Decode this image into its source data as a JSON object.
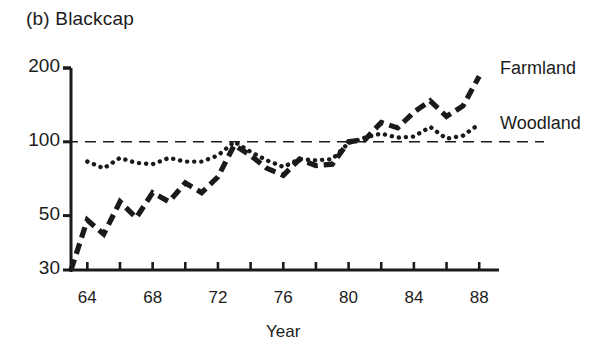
{
  "figure": {
    "panel_label": "(b) Blackcap",
    "axis_title_x": "Year",
    "ink_color": "#1a1a1a",
    "background": "#ffffff"
  },
  "legend": {
    "entries": [
      {
        "label": "Farmland",
        "style": "dashed"
      },
      {
        "label": "Woodland",
        "style": "dotted"
      }
    ]
  },
  "chart_data": {
    "type": "line",
    "title": "(b) Blackcap",
    "subtitle": "",
    "xlabel": "Year",
    "ylabel": "",
    "yscale": "log",
    "ylim": [
      30,
      215
    ],
    "xlim": [
      1963,
      1988.6
    ],
    "grid": false,
    "legend_position": "right",
    "reference_line": {
      "value": 100,
      "style": "dashed",
      "label": ""
    },
    "ytick_values": [
      30,
      50,
      100,
      200
    ],
    "ytick_labels": [
      "30",
      "50",
      "100",
      "200"
    ],
    "xtick_values": [
      1964,
      1966,
      1968,
      1970,
      1972,
      1974,
      1976,
      1978,
      1980,
      1982,
      1984,
      1986,
      1988
    ],
    "xtick_labels": [
      "64",
      "",
      "68",
      "",
      "72",
      "",
      "76",
      "",
      "80",
      "",
      "84",
      "",
      "88"
    ],
    "x": [
      1963,
      1964,
      1965,
      1966,
      1967,
      1968,
      1969,
      1970,
      1971,
      1972,
      1973,
      1974,
      1975,
      1976,
      1977,
      1978,
      1979,
      1980,
      1981,
      1982,
      1983,
      1984,
      1985,
      1986,
      1987,
      1988
    ],
    "series": [
      {
        "name": "Farmland",
        "style": "dashed",
        "x": [
          1963,
          1964,
          1965,
          1966,
          1967,
          1968,
          1969,
          1970,
          1971,
          1972,
          1973,
          1974,
          1975,
          1976,
          1977,
          1978,
          1979,
          1980,
          1981,
          1982,
          1983,
          1984,
          1985,
          1986,
          1987,
          1988
        ],
        "values": [
          30,
          48,
          42,
          57,
          49,
          62,
          57,
          68,
          62,
          72,
          97,
          88,
          78,
          73,
          85,
          80,
          81,
          100,
          102,
          120,
          114,
          132,
          147,
          127,
          140,
          185
        ]
      },
      {
        "name": "Woodland",
        "style": "dotted",
        "x": [
          1964,
          1965,
          1966,
          1967,
          1968,
          1969,
          1970,
          1971,
          1972,
          1973,
          1974,
          1975,
          1976,
          1977,
          1978,
          1979,
          1980,
          1981,
          1982,
          1983,
          1984,
          1985,
          1986,
          1987,
          1988
        ],
        "values": [
          83,
          78,
          86,
          82,
          81,
          86,
          83,
          83,
          88,
          100,
          91,
          84,
          79,
          85,
          84,
          85,
          99,
          104,
          108,
          104,
          105,
          115,
          103,
          106,
          118
        ]
      }
    ]
  }
}
